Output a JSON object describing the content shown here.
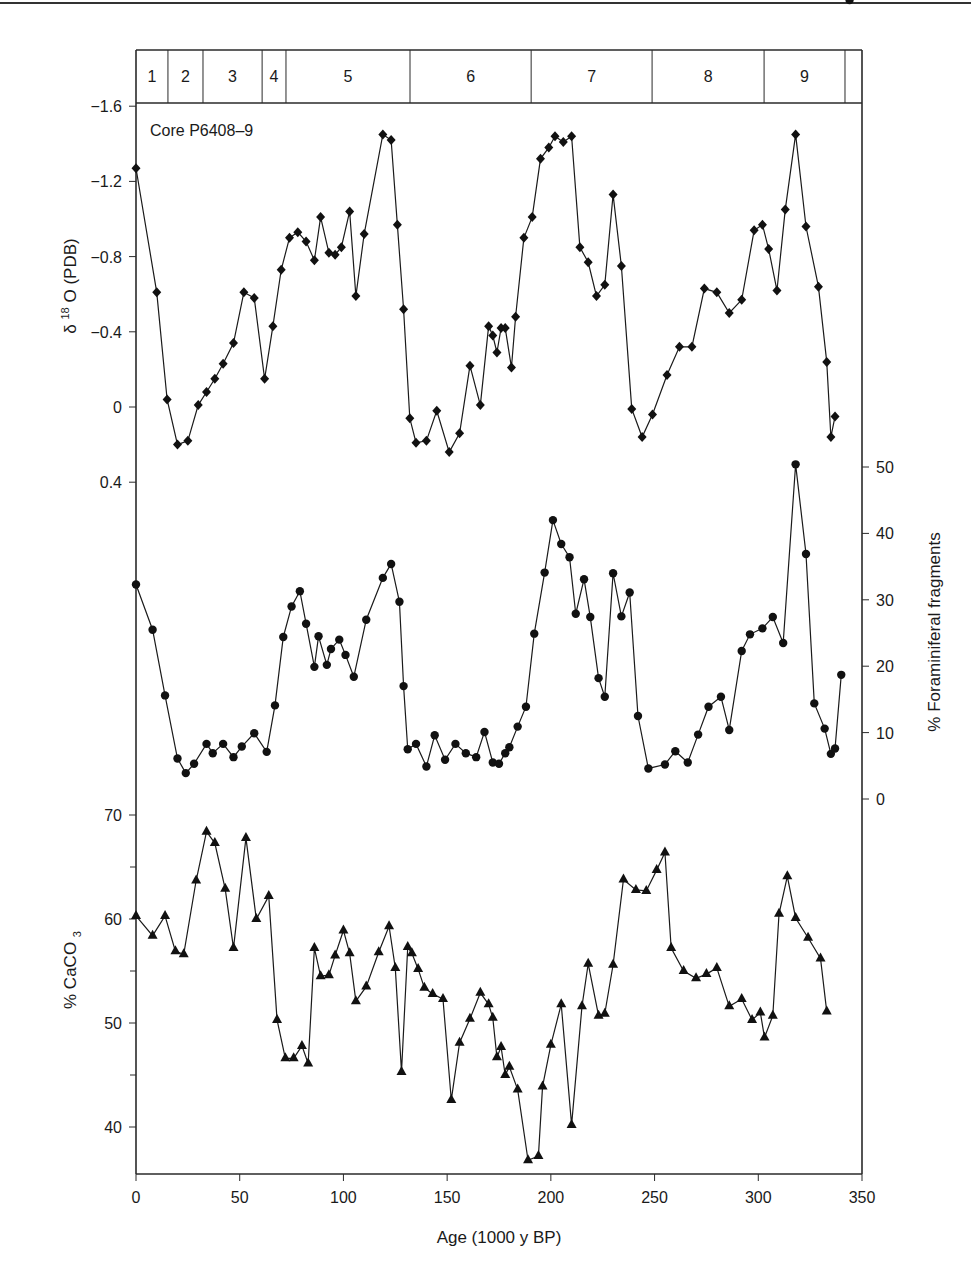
{
  "chart_data": [
    {
      "type": "line",
      "panel": "top",
      "title": "Core P6408-9",
      "annotation": "Core P6408–9",
      "xlabel": "Age (1000 y BP)",
      "ylabel": "δ 18O (PDB)",
      "ylabel_parts": {
        "delta": "δ",
        "sup": "18",
        "rest": "O (PDB)"
      },
      "y_inverted": true,
      "ylim": [
        0.4,
        -1.6
      ],
      "yticks": [
        "-1.6",
        "-1.2",
        "-0.8",
        "-0.4",
        "0",
        "0.4"
      ],
      "yticks_display": [
        "−1.6",
        "−1.2",
        "−0.8",
        "−0.4",
        "0",
        "0.4"
      ],
      "marker": "diamond",
      "x": [
        0,
        10,
        15,
        20,
        25,
        30,
        34,
        38,
        42,
        47,
        52,
        57,
        62,
        66,
        70,
        74,
        78,
        82,
        86,
        89,
        93,
        96,
        99,
        103,
        106,
        110,
        119,
        123,
        126,
        129,
        132,
        135,
        140,
        145,
        151,
        156,
        161,
        166,
        170,
        172,
        174,
        176,
        178,
        181,
        183,
        187,
        191,
        195,
        199,
        202,
        206,
        210,
        214,
        218,
        222,
        226,
        230,
        234,
        239,
        244,
        249,
        256,
        262,
        268,
        274,
        280,
        286,
        292,
        298,
        302,
        305,
        309,
        313,
        318,
        323,
        329,
        333,
        335,
        337,
        339,
        343
      ],
      "values": [
        -1.27,
        -0.61,
        -0.04,
        0.2,
        0.18,
        -0.01,
        -0.08,
        -0.15,
        -0.23,
        -0.34,
        -0.61,
        -0.58,
        -0.15,
        -0.43,
        -0.73,
        -0.9,
        -0.93,
        -0.88,
        -0.78,
        -1.01,
        -0.82,
        -0.81,
        -0.85,
        -1.04,
        -0.59,
        -0.92,
        -1.45,
        -1.42,
        -0.97,
        -0.52,
        0.06,
        0.19,
        0.18,
        0.02,
        0.24,
        0.14,
        -0.22,
        -0.01,
        -0.43,
        -0.38,
        -0.29,
        -0.42,
        -0.42,
        -0.21,
        -0.48,
        -0.9,
        -1.01,
        -1.32,
        -1.38,
        -1.44,
        -1.41,
        -1.44,
        -0.85,
        -0.77,
        -0.59,
        -0.65,
        -1.13,
        -0.75,
        0.01,
        0.16,
        0.04,
        -0.17,
        -0.32,
        -0.32,
        -0.63,
        -0.61,
        -0.5,
        -0.57,
        -0.94,
        -0.97,
        -0.84,
        -0.62,
        -1.05,
        -1.45,
        -0.96,
        -0.64,
        -0.24,
        0.16,
        0.05
      ]
    },
    {
      "type": "line",
      "panel": "middle",
      "ylabel": "% Foraminiferal fragments",
      "y_axis_side": "right",
      "ylim": [
        0,
        50
      ],
      "yticks": [
        "0",
        "10",
        "20",
        "30",
        "40",
        "50"
      ],
      "marker": "circle",
      "x": [
        0,
        8,
        14,
        20,
        24,
        28,
        34,
        37,
        42,
        47,
        51,
        57,
        63,
        67,
        71,
        75,
        79,
        82,
        86,
        88,
        92,
        94,
        98,
        101,
        105,
        111,
        119,
        123,
        127,
        129,
        131,
        135,
        140,
        144,
        149,
        154,
        159,
        164,
        168,
        172,
        175,
        178,
        180,
        184,
        188,
        192,
        197,
        201,
        205,
        209,
        212,
        216,
        219,
        223,
        226,
        230,
        234,
        238,
        242,
        247,
        255,
        260,
        266,
        271,
        276,
        282,
        286,
        292,
        296,
        302,
        307,
        312,
        318,
        323,
        327,
        332,
        335,
        337,
        340,
        344
      ],
      "values": [
        32.3,
        25.5,
        15.6,
        6.1,
        3.9,
        5.3,
        8.3,
        6.9,
        8.3,
        6.3,
        7.9,
        9.9,
        7.1,
        14.1,
        24.4,
        29.0,
        31.3,
        26.4,
        19.9,
        24.5,
        20.2,
        22.6,
        24.0,
        21.7,
        18.4,
        27.0,
        33.3,
        35.4,
        29.7,
        17.0,
        7.5,
        8.3,
        4.9,
        9.6,
        5.9,
        8.3,
        6.9,
        6.3,
        10.1,
        5.5,
        5.3,
        6.9,
        7.8,
        10.9,
        13.9,
        24.9,
        34.1,
        42.0,
        38.4,
        36.4,
        27.9,
        33.1,
        27.4,
        18.2,
        15.4,
        34.0,
        27.5,
        31.1,
        12.5,
        4.6,
        5.2,
        7.2,
        5.5,
        9.7,
        13.9,
        15.4,
        10.4,
        22.3,
        24.8,
        25.7,
        27.4,
        23.5,
        50.4,
        36.9,
        14.4,
        10.6,
        6.8,
        7.6,
        18.7
      ]
    },
    {
      "type": "line",
      "panel": "bottom",
      "ylabel": "% CaCO3",
      "ylabel_parts": {
        "main": "% CaCO",
        "sub": "3"
      },
      "ylim": [
        36,
        70
      ],
      "yticks": [
        "40",
        "50",
        "60",
        "70"
      ],
      "yticks_minor": [
        45,
        55,
        65
      ],
      "marker": "triangle",
      "x": [
        0,
        8,
        14,
        19,
        23,
        29,
        34,
        38,
        43,
        47,
        53,
        58,
        64,
        68,
        72,
        76,
        80,
        83,
        86,
        89,
        93,
        96,
        100,
        103,
        106,
        111,
        117,
        122,
        125,
        128,
        131,
        133,
        136,
        139,
        143,
        148,
        152,
        156,
        161,
        166,
        170,
        172,
        174,
        176,
        178,
        180,
        184,
        189,
        194,
        196,
        200,
        205,
        210,
        215,
        218,
        223,
        226,
        230,
        235,
        241,
        246,
        251,
        255,
        258,
        264,
        270,
        275,
        280,
        286,
        292,
        297,
        301,
        303,
        307,
        310,
        314,
        318,
        324,
        330,
        333,
        335,
        336,
        338,
        341
      ],
      "values": [
        60.3,
        58.4,
        60.3,
        56.9,
        56.6,
        63.7,
        68.4,
        67.3,
        62.9,
        57.2,
        67.8,
        60.0,
        62.2,
        50.3,
        46.6,
        46.6,
        47.8,
        46.1,
        57.2,
        54.5,
        54.6,
        56.5,
        58.9,
        56.7,
        52.1,
        53.5,
        56.8,
        59.3,
        55.3,
        45.3,
        57.3,
        56.7,
        55.2,
        53.4,
        52.8,
        52.3,
        42.6,
        48.1,
        50.4,
        52.9,
        51.8,
        50.5,
        46.7,
        47.7,
        45.0,
        45.8,
        43.6,
        36.8,
        37.2,
        43.9,
        47.9,
        51.8,
        40.2,
        51.6,
        55.7,
        50.7,
        50.9,
        55.6,
        63.8,
        62.8,
        62.7,
        64.7,
        66.4,
        57.2,
        55.0,
        54.3,
        54.7,
        55.3,
        51.6,
        52.3,
        50.3,
        51.0,
        48.6,
        50.7,
        60.5,
        64.1,
        60.1,
        58.2,
        56.2,
        51.1
      ]
    }
  ],
  "stages": {
    "title": "Marine isotope stages",
    "items": [
      {
        "label": "1",
        "start": 0,
        "end": 15.4
      },
      {
        "label": "2",
        "start": 15.4,
        "end": 32.3
      },
      {
        "label": "3",
        "start": 32.3,
        "end": 60.8
      },
      {
        "label": "4",
        "start": 60.8,
        "end": 72.3
      },
      {
        "label": "5",
        "start": 72.3,
        "end": 132.1
      },
      {
        "label": "6",
        "start": 132.1,
        "end": 190.5
      },
      {
        "label": "7",
        "start": 190.5,
        "end": 248.8
      },
      {
        "label": "8",
        "start": 248.8,
        "end": 302.8
      },
      {
        "label": "9",
        "start": 302.8,
        "end": 341.8
      },
      {
        "label": "",
        "start": 341.8,
        "end": 350
      }
    ]
  },
  "xaxis": {
    "label": "Age (1000 y BP)",
    "ticks": [
      "0",
      "50",
      "100",
      "150",
      "200",
      "250",
      "300",
      "350"
    ],
    "range": [
      0,
      350
    ]
  },
  "labels": {
    "core": "Core P6408–9",
    "top_ylabel_delta": "δ",
    "top_ylabel_sup": "18",
    "top_ylabel_rest": "O (PDB)",
    "mid_ylabel": "% Foraminiferal fragments",
    "bot_ylabel_main": "% CaCO",
    "bot_ylabel_sub": "3",
    "xlabel": "Age (1000 y BP)"
  },
  "colors": {
    "line": "#1a1a1a",
    "marker": "#111111",
    "axis": "#2a2a2a",
    "background": "#ffffff"
  }
}
